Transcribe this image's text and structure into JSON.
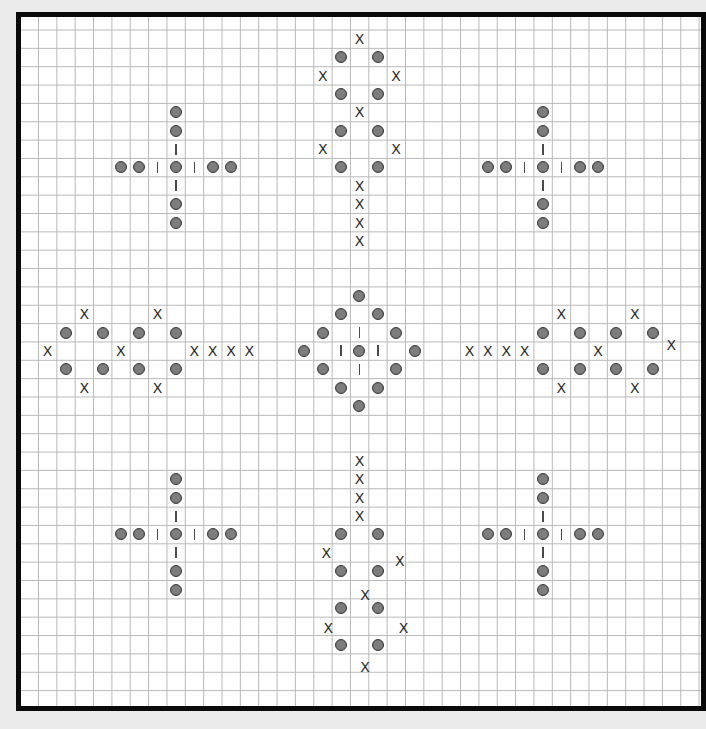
{
  "diagram": {
    "type": "grid-pattern-chart",
    "grid": {
      "cell_size_px": 18.35,
      "first_vertical_line_x": 38.5,
      "first_horizontal_line_y": 30,
      "col_center_origin_x": 47.5,
      "row_center_origin_y": 39,
      "line_color": "#b9b9b9",
      "background": "#ffffff",
      "border_color": "#0a0a0a"
    },
    "legend_symbols": {
      "bead": "filled-gray-circle",
      "x": "X",
      "bar": "vertical-bar"
    },
    "colors": {
      "bead_fill": "#7d7d7d",
      "bead_stroke": "#3c3c3c",
      "x_color": "#2b2b2b",
      "bar_color": "#4a4a4a",
      "page_background": "#ebebeb"
    },
    "motifs": [
      {
        "name": "top-left-cross",
        "beads": [
          [
            7,
            4
          ],
          [
            7,
            5
          ],
          [
            7,
            7
          ],
          [
            7,
            9
          ],
          [
            7,
            10
          ],
          [
            4,
            7
          ],
          [
            5,
            7
          ],
          [
            9,
            7
          ],
          [
            10,
            7
          ]
        ],
        "bars": [
          [
            7,
            6
          ],
          [
            7,
            8
          ],
          [
            6,
            7
          ],
          [
            8,
            7
          ]
        ],
        "xs": []
      },
      {
        "name": "top-center-chain",
        "beads": [
          [
            16,
            1
          ],
          [
            18,
            1
          ],
          [
            16,
            3
          ],
          [
            18,
            3
          ],
          [
            16,
            5
          ],
          [
            18,
            5
          ],
          [
            16,
            7
          ],
          [
            18,
            7
          ]
        ],
        "bars": [],
        "xs": [
          [
            17,
            0
          ],
          [
            15,
            2
          ],
          [
            19,
            2
          ],
          [
            17,
            4
          ],
          [
            15,
            6
          ],
          [
            19,
            6
          ],
          [
            17,
            8
          ],
          [
            17,
            9
          ],
          [
            17,
            10
          ],
          [
            17,
            11
          ]
        ]
      },
      {
        "name": "top-right-cross",
        "beads": [
          [
            27,
            4
          ],
          [
            27,
            5
          ],
          [
            27,
            7
          ],
          [
            27,
            9
          ],
          [
            27,
            10
          ],
          [
            24,
            7
          ],
          [
            25,
            7
          ],
          [
            29,
            7
          ],
          [
            30,
            7
          ]
        ],
        "bars": [
          [
            27,
            6
          ],
          [
            27,
            8
          ],
          [
            26,
            7
          ],
          [
            28,
            7
          ]
        ],
        "xs": []
      },
      {
        "name": "middle-left-chain",
        "beads": [
          [
            1,
            16
          ],
          [
            3,
            16
          ],
          [
            5,
            16
          ],
          [
            7,
            16
          ],
          [
            1,
            18
          ],
          [
            3,
            18
          ],
          [
            5,
            18
          ],
          [
            7,
            18
          ]
        ],
        "bars": [],
        "xs": [
          [
            2,
            15
          ],
          [
            6,
            15
          ],
          [
            0,
            17
          ],
          [
            4,
            17
          ],
          [
            8,
            17
          ],
          [
            9,
            17
          ],
          [
            10,
            17
          ],
          [
            11,
            17
          ],
          [
            2,
            19
          ],
          [
            6,
            19
          ]
        ]
      },
      {
        "name": "center-diamond",
        "beads": [
          [
            17,
            14
          ],
          [
            16,
            15
          ],
          [
            18,
            15
          ],
          [
            15,
            16
          ],
          [
            19,
            16
          ],
          [
            14,
            17
          ],
          [
            17,
            17
          ],
          [
            20,
            17
          ],
          [
            15,
            18
          ],
          [
            19,
            18
          ],
          [
            16,
            19
          ],
          [
            18,
            19
          ],
          [
            17,
            20
          ]
        ],
        "bars": [
          [
            17,
            16
          ],
          [
            16,
            17
          ],
          [
            18,
            17
          ],
          [
            17,
            18
          ]
        ],
        "xs": []
      },
      {
        "name": "middle-right-chain",
        "beads": [
          [
            27,
            16
          ],
          [
            29,
            16
          ],
          [
            31,
            16
          ],
          [
            33,
            16
          ],
          [
            27,
            18
          ],
          [
            29,
            18
          ],
          [
            31,
            18
          ],
          [
            33,
            18
          ]
        ],
        "bars": [],
        "xs": [
          [
            28,
            15
          ],
          [
            32,
            15
          ],
          [
            23,
            17
          ],
          [
            24,
            17
          ],
          [
            25,
            17
          ],
          [
            26,
            17
          ],
          [
            30,
            17
          ],
          [
            34,
            16.7
          ],
          [
            28,
            19
          ],
          [
            32,
            19
          ]
        ]
      },
      {
        "name": "bottom-left-cross",
        "beads": [
          [
            7,
            24
          ],
          [
            7,
            25
          ],
          [
            7,
            27
          ],
          [
            7,
            29
          ],
          [
            7,
            30
          ],
          [
            4,
            27
          ],
          [
            5,
            27
          ],
          [
            9,
            27
          ],
          [
            10,
            27
          ]
        ],
        "bars": [
          [
            7,
            26
          ],
          [
            7,
            28
          ],
          [
            6,
            27
          ],
          [
            8,
            27
          ]
        ],
        "xs": []
      },
      {
        "name": "bottom-center-chain",
        "beads": [
          [
            16,
            27
          ],
          [
            18,
            27
          ],
          [
            16,
            29
          ],
          [
            18,
            29
          ],
          [
            16,
            31
          ],
          [
            18,
            31
          ],
          [
            16,
            33
          ],
          [
            18,
            33
          ]
        ],
        "bars": [],
        "xs": [
          [
            17,
            23
          ],
          [
            17,
            24
          ],
          [
            17,
            25
          ],
          [
            17,
            26
          ],
          [
            15.2,
            28
          ],
          [
            19.2,
            28.45
          ],
          [
            17.3,
            30.3
          ],
          [
            15.3,
            32.1
          ],
          [
            19.4,
            32.1
          ],
          [
            17.3,
            34.2
          ]
        ]
      },
      {
        "name": "bottom-right-cross",
        "beads": [
          [
            27,
            24
          ],
          [
            27,
            25
          ],
          [
            27,
            27
          ],
          [
            27,
            29
          ],
          [
            27,
            30
          ],
          [
            24,
            27
          ],
          [
            25,
            27
          ],
          [
            29,
            27
          ],
          [
            30,
            27
          ]
        ],
        "bars": [
          [
            27,
            26
          ],
          [
            27,
            28
          ],
          [
            26,
            27
          ],
          [
            28,
            27
          ]
        ],
        "xs": []
      }
    ]
  }
}
